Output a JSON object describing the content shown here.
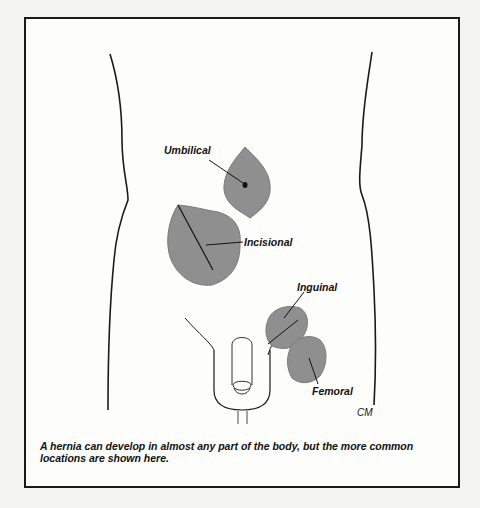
{
  "figure": {
    "caption": "A hernia can develop in almost any part of the body, but the more common locations are shown here.",
    "labels": {
      "umbilical": "Umbilical",
      "incisional": "Incisional",
      "inguinal": "Inguinal",
      "femoral": "Femoral"
    },
    "signature": "CM",
    "colors": {
      "hernia_fill": "#8f8f8f",
      "outline": "#1a1a1a",
      "background": "#fdfdfc"
    }
  }
}
